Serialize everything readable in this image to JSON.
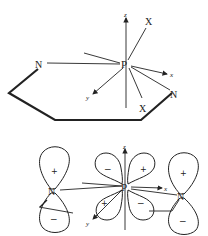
{
  "top_figure": {
    "center_atom": "P",
    "ring_atoms": [
      "N",
      "N"
    ],
    "substituents": [
      "X",
      "X"
    ],
    "axes": {
      "z": "z",
      "x": "x",
      "y": "y"
    }
  },
  "bottom_figure": {
    "center_atom": "P",
    "left_atom": "N",
    "right_atom": "N",
    "axes": {
      "z": "z",
      "x": "x",
      "y": "y"
    },
    "left_n_lobes": {
      "upper": "+",
      "lower": "−"
    },
    "right_n_lobes": {
      "upper": "+",
      "lower": "−"
    },
    "p_d_lobes": {
      "upper_left": "−",
      "upper_right": "+",
      "lower_left": "+",
      "lower_right": "−"
    }
  },
  "colors": {
    "line": "#222222",
    "background": "#ffffff"
  }
}
